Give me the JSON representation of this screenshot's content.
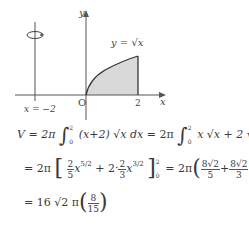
{
  "figure": {
    "axis_x_label": "x",
    "axis_y_label": "y",
    "origin_label": "O",
    "tick_x_label": "2",
    "curve_label": "y = √x",
    "rotation_axis_label": "x = −2",
    "rotation_icon": "rotation-arrow-icon",
    "colors": {
      "shade": "#d9d9d9",
      "axis": "#555555",
      "curve": "#333333"
    }
  },
  "equations": {
    "line1": {
      "lhs": "V = 2π",
      "int1_upper": "2",
      "int1_lower": "0",
      "int1_body": "(x+2) √x  dx",
      "eq2": "= 2π",
      "int2_upper": "2",
      "int2_lower": "0",
      "int2_body": "x √x  + 2 √x  dx"
    },
    "line2": {
      "prefix": "= 2π",
      "f1_num": "2",
      "f1_den": "5",
      "x1": "x",
      "exp1": "5/2",
      "plus": "+ 2·",
      "f2_num": "2",
      "f2_den": "3",
      "x2": "x",
      "exp2": "3/2",
      "upper": "2",
      "lower": "0",
      "eq": "= 2π",
      "f3_num": "8√2",
      "f3_den": "5",
      "plus2": "+",
      "f4_num": "8√2",
      "f4_den": "3"
    },
    "line3": {
      "prefix": "= 16 √2 π",
      "f_num": "8",
      "f_den": "15"
    }
  }
}
